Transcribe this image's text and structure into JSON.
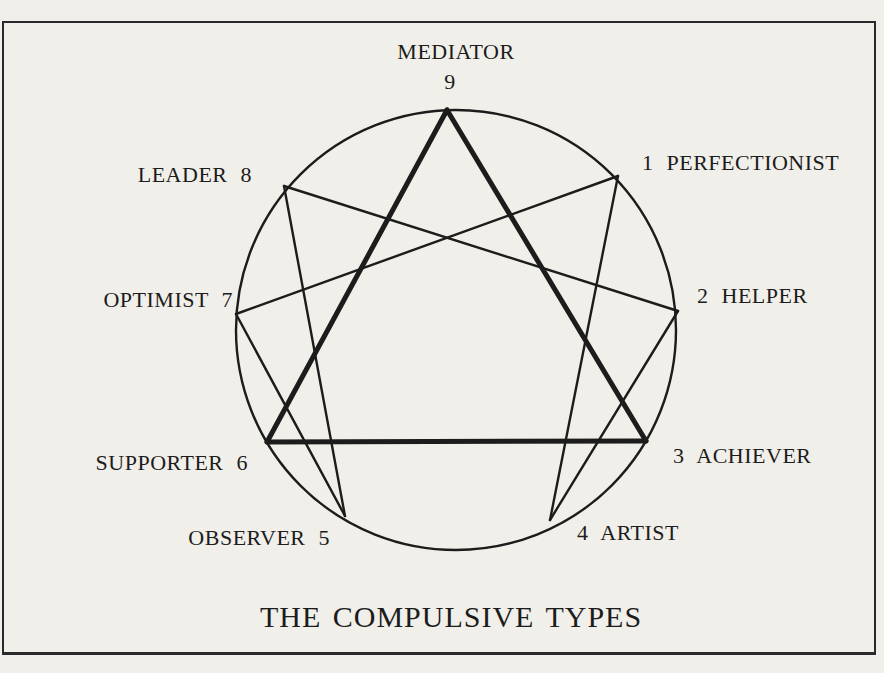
{
  "page": {
    "background": "#f1efe9",
    "ink": "#1c1c1c",
    "border_color": "#2a2a2e"
  },
  "title": {
    "text": "THE COMPULSIVE TYPES",
    "x": 451,
    "y": 599
  },
  "enneagram": {
    "circle": {
      "cx": 456,
      "cy": 330,
      "r": 220,
      "stroke_width": 2.4
    },
    "nodes": {
      "9": {
        "x": 447,
        "y": 110
      },
      "1": {
        "x": 618,
        "y": 176
      },
      "2": {
        "x": 678,
        "y": 311
      },
      "3": {
        "x": 646,
        "y": 441
      },
      "4": {
        "x": 550,
        "y": 520
      },
      "5": {
        "x": 345,
        "y": 516
      },
      "6": {
        "x": 267,
        "y": 442
      },
      "7": {
        "x": 236,
        "y": 314
      },
      "8": {
        "x": 284,
        "y": 186
      }
    },
    "triangle": {
      "stroke_width": 5,
      "connections": [
        [
          "9",
          "3"
        ],
        [
          "3",
          "6"
        ],
        [
          "6",
          "9"
        ]
      ]
    },
    "hexad": {
      "stroke_width": 2.4,
      "connections": [
        [
          "1",
          "4"
        ],
        [
          "4",
          "2"
        ],
        [
          "2",
          "8"
        ],
        [
          "8",
          "5"
        ],
        [
          "5",
          "7"
        ],
        [
          "7",
          "1"
        ]
      ]
    },
    "labels": [
      {
        "name": "mediator-label",
        "text": "MEDIATOR",
        "x": 456,
        "y": 40,
        "anchor": "middle"
      },
      {
        "name": "mediator-number",
        "text": "9",
        "x": 450,
        "y": 70,
        "anchor": "middle"
      },
      {
        "name": "leader-label",
        "text": "LEADER 8",
        "x": 252,
        "y": 163,
        "anchor": "end"
      },
      {
        "name": "perfectionist-label",
        "text": "1 PERFECTIONIST",
        "x": 642,
        "y": 151,
        "anchor": "start"
      },
      {
        "name": "optimist-label",
        "text": "OPTIMIST 7",
        "x": 233,
        "y": 288,
        "anchor": "end"
      },
      {
        "name": "helper-label",
        "text": "2 HELPER",
        "x": 697,
        "y": 284,
        "anchor": "start"
      },
      {
        "name": "supporter-label",
        "text": "SUPPORTER 6",
        "x": 248,
        "y": 451,
        "anchor": "end"
      },
      {
        "name": "achiever-label",
        "text": "3 ACHIEVER",
        "x": 673,
        "y": 444,
        "anchor": "start"
      },
      {
        "name": "observer-label",
        "text": "OBSERVER 5",
        "x": 330,
        "y": 526,
        "anchor": "end"
      },
      {
        "name": "artist-label",
        "text": "4 ARTIST",
        "x": 577,
        "y": 521,
        "anchor": "start"
      }
    ]
  }
}
